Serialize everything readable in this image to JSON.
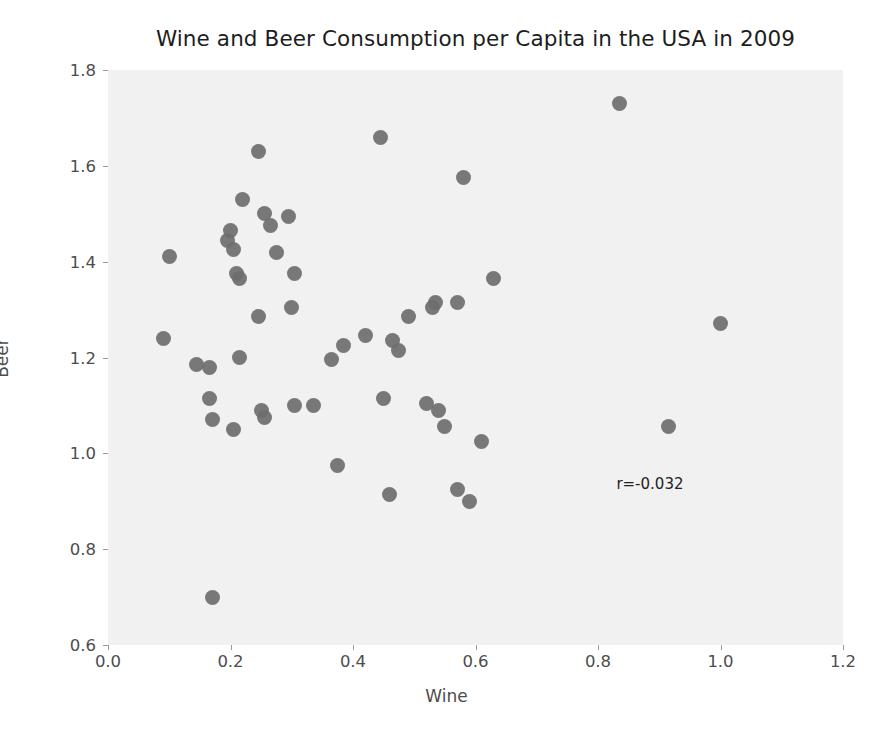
{
  "chart_data": {
    "type": "scatter",
    "title": "Wine and Beer Consumption per Capita in the USA in 2009",
    "xlabel": "Wine",
    "ylabel": "Beer",
    "xlim": [
      0.0,
      1.2
    ],
    "ylim": [
      0.6,
      1.8
    ],
    "xticks": [
      "0.0",
      "0.2",
      "0.4",
      "0.6",
      "0.8",
      "1.0",
      "1.2"
    ],
    "xtick_values": [
      0.0,
      0.2,
      0.4,
      0.6,
      0.8,
      1.0,
      1.2
    ],
    "yticks": [
      "0.6",
      "0.8",
      "1.0",
      "1.2",
      "1.4",
      "1.6",
      "1.8"
    ],
    "ytick_values": [
      0.6,
      0.8,
      1.0,
      1.2,
      1.4,
      1.6,
      1.8
    ],
    "grid": false,
    "legend": null,
    "annotations": [
      {
        "text": "r=-0.032",
        "x": 0.83,
        "y": 0.955
      }
    ],
    "marker_color": "#6e6e6e",
    "plot_background": "#f1f1f1",
    "figure_background": "#ffffff",
    "series": [
      {
        "name": "US states",
        "points": [
          [
            0.1,
            1.41
          ],
          [
            0.09,
            1.24
          ],
          [
            0.145,
            1.185
          ],
          [
            0.165,
            1.18
          ],
          [
            0.165,
            1.115
          ],
          [
            0.17,
            1.07
          ],
          [
            0.17,
            0.7
          ],
          [
            0.195,
            1.445
          ],
          [
            0.2,
            1.465
          ],
          [
            0.205,
            1.425
          ],
          [
            0.205,
            1.05
          ],
          [
            0.21,
            1.375
          ],
          [
            0.215,
            1.365
          ],
          [
            0.215,
            1.2
          ],
          [
            0.22,
            1.53
          ],
          [
            0.245,
            1.63
          ],
          [
            0.245,
            1.285
          ],
          [
            0.25,
            1.09
          ],
          [
            0.255,
            1.5
          ],
          [
            0.255,
            1.075
          ],
          [
            0.265,
            1.475
          ],
          [
            0.275,
            1.42
          ],
          [
            0.295,
            1.495
          ],
          [
            0.3,
            1.305
          ],
          [
            0.305,
            1.375
          ],
          [
            0.305,
            1.1
          ],
          [
            0.335,
            1.1
          ],
          [
            0.365,
            1.195
          ],
          [
            0.375,
            0.975
          ],
          [
            0.385,
            1.225
          ],
          [
            0.42,
            1.245
          ],
          [
            0.445,
            1.66
          ],
          [
            0.45,
            1.115
          ],
          [
            0.46,
            0.915
          ],
          [
            0.465,
            1.235
          ],
          [
            0.475,
            1.215
          ],
          [
            0.49,
            1.285
          ],
          [
            0.52,
            1.105
          ],
          [
            0.53,
            1.305
          ],
          [
            0.535,
            1.315
          ],
          [
            0.54,
            1.09
          ],
          [
            0.55,
            1.055
          ],
          [
            0.57,
            1.315
          ],
          [
            0.57,
            0.925
          ],
          [
            0.58,
            1.575
          ],
          [
            0.59,
            0.9
          ],
          [
            0.61,
            1.025
          ],
          [
            0.63,
            1.365
          ],
          [
            0.835,
            1.73
          ],
          [
            0.915,
            1.055
          ],
          [
            1.0,
            1.27
          ]
        ]
      }
    ]
  }
}
